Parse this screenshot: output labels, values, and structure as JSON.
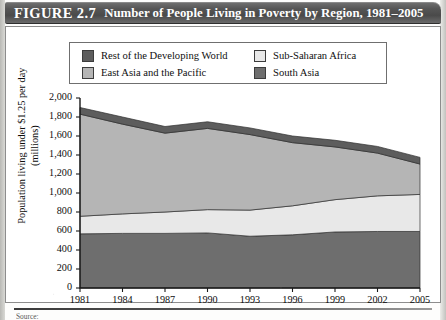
{
  "figure": {
    "number_label": "FIGURE 2.7",
    "title": "Number of People Living in Poverty by Region, 1981–2005",
    "source_note": "Source:"
  },
  "colors": {
    "rest_of_developing_world": "#5d5d5d",
    "east_asia_pacific": "#b5b5b5",
    "sub_saharan_africa": "#e8e8e8",
    "south_asia": "#6e6e6e",
    "banner_dark": "#4a4a4a",
    "frame": "#8d8d8d",
    "axis": "#1a1a1a"
  },
  "legend": {
    "entries": [
      {
        "label": "Rest of the Developing World",
        "color": "#5d5d5d"
      },
      {
        "label": "Sub-Saharan Africa",
        "color": "#e8e8e8"
      },
      {
        "label": "East Asia and the Pacific",
        "color": "#b5b5b5"
      },
      {
        "label": "South Asia",
        "color": "#6e6e6e"
      }
    ]
  },
  "chart_data": {
    "type": "area",
    "stacked": true,
    "title": "Number of People Living in Poverty by Region, 1981–2005",
    "xlabel": "",
    "ylabel": "Population living under $1.25 per day (millions)",
    "ylabel_lines": [
      "Population living under $1.25 per day",
      "(millions)"
    ],
    "x": [
      1981,
      1984,
      1987,
      1990,
      1993,
      1996,
      1999,
      2002,
      2005
    ],
    "xticklabels": [
      "1981",
      "1984",
      "1987",
      "1990",
      "1993",
      "1996",
      "1999",
      "2002",
      "2005"
    ],
    "yticks": [
      0,
      200,
      400,
      600,
      800,
      1000,
      1200,
      1400,
      1600,
      1800,
      2000
    ],
    "yticklabels": [
      "0",
      "200",
      "400",
      "600",
      "800",
      "1,000",
      "1,200",
      "1,400",
      "1,600",
      "1,800",
      "2,000"
    ],
    "ylim": [
      0,
      2000
    ],
    "grid": false,
    "legend_position": "top",
    "stack_order_bottom_to_top": [
      "South Asia",
      "Sub-Saharan Africa",
      "East Asia and the Pacific",
      "Rest of the Developing World"
    ],
    "series": [
      {
        "name": "South Asia",
        "color": "#6e6e6e",
        "values": [
          570,
          575,
          575,
          580,
          545,
          560,
          590,
          595,
          595
        ]
      },
      {
        "name": "Sub-Saharan Africa",
        "color": "#e8e8e8",
        "values": [
          185,
          205,
          225,
          245,
          275,
          305,
          340,
          375,
          390
        ]
      },
      {
        "name": "East Asia and the Pacific",
        "color": "#b5b5b5",
        "values": [
          1075,
          945,
          830,
          855,
          795,
          665,
          555,
          450,
          320
        ]
      },
      {
        "name": "Rest of the Developing World",
        "color": "#5d5d5d",
        "values": [
          70,
          75,
          70,
          70,
          70,
          70,
          70,
          70,
          70
        ]
      }
    ],
    "totals": [
      1900,
      1800,
      1700,
      1750,
      1685,
      1600,
      1555,
      1490,
      1375
    ]
  }
}
